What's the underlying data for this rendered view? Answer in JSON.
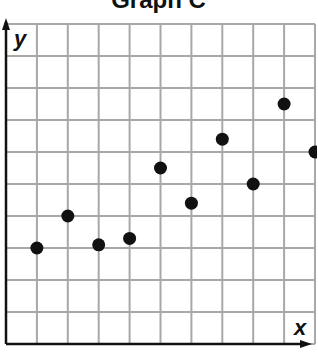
{
  "title": "Graph C",
  "chart_data": {
    "type": "scatter",
    "title": "Graph C",
    "xlabel": "x",
    "ylabel": "y",
    "xlim": [
      0,
      10
    ],
    "ylim": [
      0,
      10
    ],
    "grid": true,
    "tick_labels": false,
    "legend": null,
    "points": [
      {
        "x": 1,
        "y": 3.0
      },
      {
        "x": 2,
        "y": 4.0
      },
      {
        "x": 3,
        "y": 3.1
      },
      {
        "x": 4,
        "y": 3.3
      },
      {
        "x": 5,
        "y": 5.5
      },
      {
        "x": 6,
        "y": 4.4
      },
      {
        "x": 7,
        "y": 6.4
      },
      {
        "x": 8,
        "y": 5.0
      },
      {
        "x": 9,
        "y": 7.5
      },
      {
        "x": 10,
        "y": 6.0
      }
    ]
  },
  "colors": {
    "grid": "#a8a8a8",
    "axis": "#111111",
    "point": "#111111",
    "background": "#ffffff"
  }
}
